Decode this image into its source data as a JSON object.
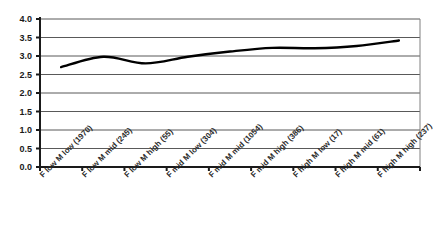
{
  "chart_data": {
    "type": "line",
    "title": "",
    "subtitle": "",
    "xlabel": "",
    "ylabel": "",
    "categories": [
      "F low M low (1970)",
      "F low M mid (245)",
      "F low M high (55)",
      "F mid M low (304)",
      "F mid M mid (1054)",
      "F mid M high (386)",
      "F high M low (17)",
      "F high M mid (61)",
      "F high M high (237)"
    ],
    "values": [
      2.7,
      2.98,
      2.8,
      2.98,
      3.12,
      3.22,
      3.21,
      3.27,
      3.42
    ],
    "series": [
      {
        "name": "",
        "values": [
          2.7,
          2.98,
          2.8,
          2.98,
          3.12,
          3.22,
          3.21,
          3.27,
          3.42
        ]
      }
    ],
    "ylim": [
      0.0,
      4.0
    ],
    "ytick_labels": [
      "0.0",
      "0.5",
      "1.0",
      "1.5",
      "2.0",
      "2.5",
      "3.0",
      "3.5",
      "4.0"
    ],
    "ytick_values": [
      0.0,
      0.5,
      1.0,
      1.5,
      2.0,
      2.5,
      3.0,
      3.5,
      4.0
    ],
    "grid": true,
    "grid_axis": "y",
    "legend": false,
    "legend_position": "none",
    "markers": false,
    "smoothed": true,
    "annotations": []
  },
  "style": {
    "line_color": "#000000",
    "grid_color": "#595959",
    "axis_color": "#1a1a1a",
    "plot_background": "#ffffff",
    "page_background": "#ffffff",
    "line_width": 2.4,
    "xlabel_rotation": -45
  },
  "plot_geometry": {
    "left": 40,
    "right": 420,
    "top": 19,
    "bottom": 167
  }
}
